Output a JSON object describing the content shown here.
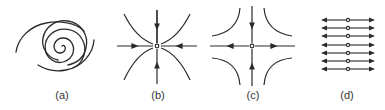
{
  "figure": {
    "panels": [
      {
        "id": "a",
        "label": "(a)",
        "type": "spiral",
        "center": [
          62,
          46
        ]
      },
      {
        "id": "b",
        "label": "(b)",
        "type": "stable-node",
        "center": [
          157,
          46
        ]
      },
      {
        "id": "c",
        "label": "(c)",
        "type": "saddle",
        "center": [
          252,
          46
        ]
      },
      {
        "id": "d",
        "label": "(d)",
        "type": "line-of-fixed-points",
        "center": [
          348,
          44
        ],
        "line_count": 7
      }
    ],
    "stroke_color": "#2a2a2a"
  }
}
